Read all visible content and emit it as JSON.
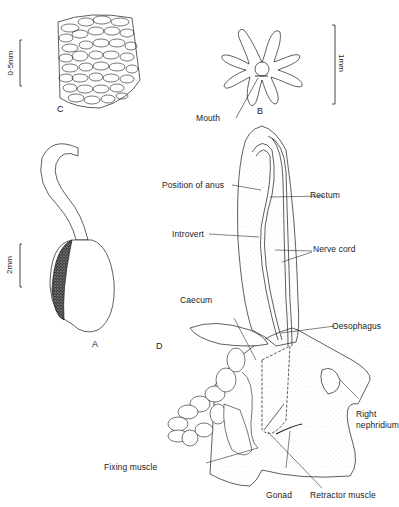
{
  "figure": {
    "panels": {
      "A": {
        "label": "A",
        "scale": "2mm",
        "subject": "whole animal with introvert"
      },
      "B": {
        "label": "B",
        "scale": "1mm",
        "subject": "oral tentacles"
      },
      "C": {
        "label": "C",
        "scale": "0·5mm",
        "subject": "body wall papillae"
      },
      "D": {
        "label": "D",
        "subject": "internal anatomy dissection"
      }
    },
    "labels": {
      "mouth": "Mouth",
      "position_of_anus": "Position of anus",
      "rectum": "Rectum",
      "introvert": "Introvert",
      "nerve_cord": "Nerve cord",
      "caecum": "Caecum",
      "oesophagus": "Oesophagus",
      "right_nephridium_line1": "Right",
      "right_nephridium_line2": "nephridium",
      "fixing_muscle": "Fixing muscle",
      "gonad": "Gonad",
      "retractor_muscle": "Retractor muscle"
    },
    "colors": {
      "ink": "#1a1a1a",
      "stipple": "#b5b5b5",
      "background": "#ffffff"
    }
  }
}
